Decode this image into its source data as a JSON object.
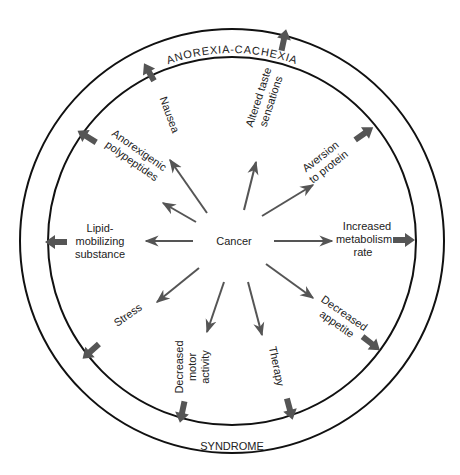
{
  "diagram": {
    "title_top": "ANOREXIA-CACHEXIA",
    "title_bottom": "SYNDROME",
    "center_label": "Cancer",
    "colors": {
      "ring": "#111111",
      "arrow": "#555555",
      "text": "#222222"
    },
    "factors": [
      {
        "id": "nausea",
        "lines": [
          "Nausea"
        ]
      },
      {
        "id": "altered-taste",
        "lines": [
          "Altered taste",
          "sensations"
        ]
      },
      {
        "id": "aversion-protein",
        "lines": [
          "Aversion",
          "to protein"
        ]
      },
      {
        "id": "increased-metabolism",
        "lines": [
          "Increased",
          "metabolism",
          "rate"
        ]
      },
      {
        "id": "decreased-appetite",
        "lines": [
          "Decreased",
          "appetite"
        ]
      },
      {
        "id": "therapy",
        "lines": [
          "Therapy"
        ]
      },
      {
        "id": "decreased-motor",
        "lines": [
          "Decreased",
          "motor",
          "activity"
        ]
      },
      {
        "id": "stress",
        "lines": [
          "Stress"
        ]
      },
      {
        "id": "lipid-mobilizing",
        "lines": [
          "Lipid-",
          "mobilizing",
          "substance"
        ]
      },
      {
        "id": "anorexigenic",
        "lines": [
          "Anorexigenic",
          "polypeptides"
        ]
      }
    ]
  }
}
